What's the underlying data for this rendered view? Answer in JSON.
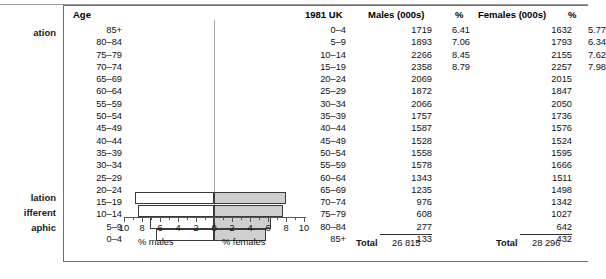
{
  "margin_notes": [
    {
      "text": "ation"
    },
    {
      "text": "lation"
    },
    {
      "text": "ifferent"
    },
    {
      "text": "aphic"
    }
  ],
  "headers": {
    "age": "Age",
    "year": "1981 UK",
    "males": "Males (000s)",
    "males_pct": "%",
    "females": "Females (000s)",
    "females_pct": "%"
  },
  "age_labels": [
    "85+",
    "80–84",
    "75–79",
    "70–74",
    "65–69",
    "60–64",
    "55–59",
    "50–54",
    "45–49",
    "40–44",
    "35–39",
    "30–34",
    "25–29",
    "20–24",
    "15–19",
    "10–14",
    "5–9",
    "0–4"
  ],
  "table_rows": [
    {
      "age": "0–4",
      "males": "1719",
      "males_pct": "6.41",
      "females": "1632",
      "females_pct": "5.77"
    },
    {
      "age": "5–9",
      "males": "1893",
      "males_pct": "7.06",
      "females": "1793",
      "females_pct": "6.34"
    },
    {
      "age": "10–14",
      "males": "2266",
      "males_pct": "8.45",
      "females": "2155",
      "females_pct": "7.62"
    },
    {
      "age": "15–19",
      "males": "2358",
      "males_pct": "8.79",
      "females": "2257",
      "females_pct": "7.98"
    },
    {
      "age": "20–24",
      "males": "2069",
      "males_pct": "",
      "females": "2015",
      "females_pct": ""
    },
    {
      "age": "25–29",
      "males": "1872",
      "males_pct": "",
      "females": "1847",
      "females_pct": ""
    },
    {
      "age": "30–34",
      "males": "2066",
      "males_pct": "",
      "females": "2050",
      "females_pct": ""
    },
    {
      "age": "35–39",
      "males": "1757",
      "males_pct": "",
      "females": "1736",
      "females_pct": ""
    },
    {
      "age": "40–44",
      "males": "1587",
      "males_pct": "",
      "females": "1576",
      "females_pct": ""
    },
    {
      "age": "45–49",
      "males": "1528",
      "males_pct": "",
      "females": "1524",
      "females_pct": ""
    },
    {
      "age": "50–54",
      "males": "1558",
      "males_pct": "",
      "females": "1595",
      "females_pct": ""
    },
    {
      "age": "55–59",
      "males": "1578",
      "males_pct": "",
      "females": "1666",
      "females_pct": ""
    },
    {
      "age": "60–64",
      "males": "1343",
      "males_pct": "",
      "females": "1511",
      "females_pct": ""
    },
    {
      "age": "65–69",
      "males": "1235",
      "males_pct": "",
      "females": "1498",
      "females_pct": ""
    },
    {
      "age": "70–74",
      "males": "976",
      "males_pct": "",
      "females": "1342",
      "females_pct": ""
    },
    {
      "age": "75–79",
      "males": "608",
      "males_pct": "",
      "females": "1027",
      "females_pct": ""
    },
    {
      "age": "80–84",
      "males": "277",
      "males_pct": "",
      "females": "642",
      "females_pct": ""
    },
    {
      "age": "85+",
      "males": "133",
      "males_pct": "",
      "females": "432",
      "females_pct": ""
    }
  ],
  "totals": {
    "males_label": "Total",
    "males_value": "26 815",
    "females_label": "Total",
    "females_value": "28 296"
  },
  "axis": {
    "tick_labels": [
      "10",
      "8",
      "6",
      "4",
      "2",
      "0",
      "2",
      "4",
      "6",
      "8",
      "10"
    ],
    "males_title": "% males",
    "females_title": "% females"
  },
  "colors": {
    "male_bar": "#ffffff",
    "female_bar": "#cfcfcf",
    "bar_outline": "#3a3a3a",
    "box_border": "#6d6d6d"
  },
  "chart_data": {
    "type": "bar",
    "xlabel": "% of population",
    "ylabel": "Age",
    "xlim": [
      -10,
      10
    ],
    "grid": false,
    "legend": [
      "% males",
      "% females"
    ],
    "categories": [
      "0–4",
      "5–9",
      "10–14",
      "15–19",
      "20–24",
      "25–29",
      "30–34",
      "35–39",
      "40–44",
      "45–49",
      "50–54",
      "55–59",
      "60–64",
      "65–69",
      "70–74",
      "75–79",
      "80–84",
      "85+"
    ],
    "series": [
      {
        "name": "% males",
        "values": [
          6.41,
          7.06,
          8.45,
          8.79,
          null,
          null,
          null,
          null,
          null,
          null,
          null,
          null,
          null,
          null,
          null,
          null,
          null,
          null
        ]
      },
      {
        "name": "% females",
        "values": [
          5.77,
          6.34,
          7.62,
          7.98,
          null,
          null,
          null,
          null,
          null,
          null,
          null,
          null,
          null,
          null,
          null,
          null,
          null,
          null
        ]
      }
    ],
    "counts_thousands": {
      "males": [
        1719,
        1893,
        2266,
        2358,
        2069,
        1872,
        2066,
        1757,
        1587,
        1528,
        1558,
        1578,
        1343,
        1235,
        976,
        608,
        277,
        133
      ],
      "females": [
        1632,
        1793,
        2155,
        2257,
        2015,
        1847,
        2050,
        1736,
        1576,
        1524,
        1595,
        1666,
        1511,
        1498,
        1342,
        1027,
        642,
        432
      ],
      "males_total": 26815,
      "females_total": 28296
    },
    "note": "Only the four youngest cohorts (0-4, 5-9, 10-14, 15-19) are drawn as bars in the figure."
  }
}
